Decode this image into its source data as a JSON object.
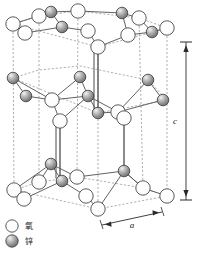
{
  "figure": {
    "background_color": "#ffffff",
    "line_color": "#4a4a4a",
    "dashed_line_color": "#8a8a8a",
    "bond_color": "#555555"
  },
  "dimensions": {
    "c_label": "c",
    "a_label": "a"
  },
  "legend": {
    "items": [
      {
        "symbol": "open-circle",
        "label": "氧",
        "fill": "#ffffff",
        "stroke": "#4a4a4a"
      },
      {
        "symbol": "shaded-sphere",
        "label": "锌",
        "fill": "#8c8c8c",
        "stroke": "#3a3a3a"
      }
    ]
  },
  "atoms": {
    "oxygen": {
      "name": "氧",
      "color": "#ffffff",
      "stroke": "#4a4a4a",
      "radius": 7.2,
      "positions": [
        [
          13,
          24
        ],
        [
          39,
          16
        ],
        [
          78,
          11
        ],
        [
          139,
          18
        ],
        [
          167,
          28
        ],
        [
          25,
          33
        ],
        [
          88,
          31
        ],
        [
          128,
          35
        ],
        [
          98,
          47
        ],
        [
          52,
          100
        ],
        [
          118,
          112
        ],
        [
          60,
          121
        ],
        [
          124,
          118
        ],
        [
          14,
          190
        ],
        [
          77,
          177
        ],
        [
          143,
          188
        ],
        [
          24,
          199
        ],
        [
          86,
          196
        ],
        [
          98,
          209
        ]
      ]
    },
    "zinc": {
      "name": "锌",
      "color": "#8c8c8c",
      "stroke": "#3a3a3a",
      "radius": 5.8,
      "positions": [
        [
          51,
          12
        ],
        [
          122,
          13
        ],
        [
          62,
          27
        ],
        [
          152,
          32
        ],
        [
          13,
          78
        ],
        [
          80,
          77
        ],
        [
          148,
          80
        ],
        [
          26,
          96
        ],
        [
          88,
          96
        ],
        [
          163,
          100
        ],
        [
          98,
          113
        ],
        [
          51,
          164
        ],
        [
          124,
          171
        ],
        [
          62,
          181
        ]
      ]
    }
  },
  "prism": {
    "top_hexagon": [
      [
        13,
        24
      ],
      [
        39,
        16
      ],
      [
        78,
        11
      ],
      [
        139,
        18
      ],
      [
        167,
        28
      ],
      [
        98,
        47
      ]
    ],
    "bottom_hexagon": [
      [
        14,
        190
      ],
      [
        39,
        182
      ],
      [
        77,
        177
      ],
      [
        143,
        188
      ],
      [
        167,
        196
      ],
      [
        98,
        209
      ]
    ],
    "vertical_edges": [
      [
        13,
        24,
        14,
        190
      ],
      [
        39,
        16,
        39,
        182
      ],
      [
        78,
        11,
        77,
        177
      ],
      [
        139,
        18,
        143,
        188
      ],
      [
        167,
        28,
        167,
        196
      ],
      [
        98,
        47,
        98,
        209
      ]
    ]
  }
}
